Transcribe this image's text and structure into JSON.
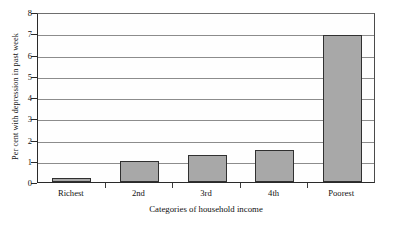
{
  "chart_data": {
    "type": "bar",
    "title": "",
    "xlabel": "Categories of household income",
    "ylabel": "Per cent with depression in past week",
    "categories": [
      "Richest",
      "2nd",
      "3rd",
      "4th",
      "Poorest"
    ],
    "values": [
      0.2,
      1.0,
      1.25,
      1.5,
      6.9
    ],
    "ylim": [
      0,
      8
    ],
    "ytick_labels": [
      "0",
      "1",
      "2",
      "3",
      "4",
      "5",
      "6",
      "7",
      "8"
    ],
    "ytick_values": [
      0,
      1,
      2,
      3,
      4,
      5,
      6,
      7,
      8
    ],
    "grid": true,
    "legend": "none",
    "series": [
      {
        "name": "Per cent with depression in past week",
        "values": [
          0.2,
          1.0,
          1.25,
          1.5,
          6.9
        ]
      }
    ],
    "colors": {
      "bar_fill": "#a8a8a8",
      "bar_edge": "#303030",
      "gridline": "#8c8c8c",
      "axis": "#2a2a2a",
      "text": "#111111",
      "background": "#ffffff"
    }
  }
}
